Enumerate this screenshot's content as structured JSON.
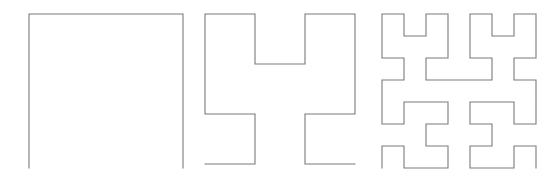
{
  "figure": {
    "background_color": "#ffffff",
    "width": 553,
    "height": 182,
    "stroke_color": "#7a7a7a",
    "stroke_width": 1.1
  },
  "chart_data": {
    "type": "line",
    "subtitle": "",
    "xlabel": "",
    "ylabel": "",
    "grid": false,
    "legend": "none",
    "panels": [
      {
        "name": "order-1-curve",
        "order": 1,
        "segments": 3,
        "vertices": 4,
        "left": 27,
        "top": 14,
        "size": 154,
        "grid_cells": 2,
        "orientation": "opens-downward"
      },
      {
        "name": "order-2-curve",
        "order": 2,
        "segments": 15,
        "vertices": 16,
        "left": 203,
        "top": 14,
        "size": 150,
        "grid_cells": 4,
        "orientation": "opens-downward"
      },
      {
        "name": "order-3-curve",
        "order": 3,
        "segments": 63,
        "vertices": 64,
        "left": 380,
        "top": 14,
        "size": 154,
        "grid_cells": 8,
        "orientation": "opens-downward"
      }
    ],
    "axis_ranges": {
      "x": [
        0,
        1
      ],
      "y": [
        0,
        1
      ]
    }
  },
  "labels": {
    "panel_1": "",
    "panel_2": "",
    "panel_3": ""
  }
}
